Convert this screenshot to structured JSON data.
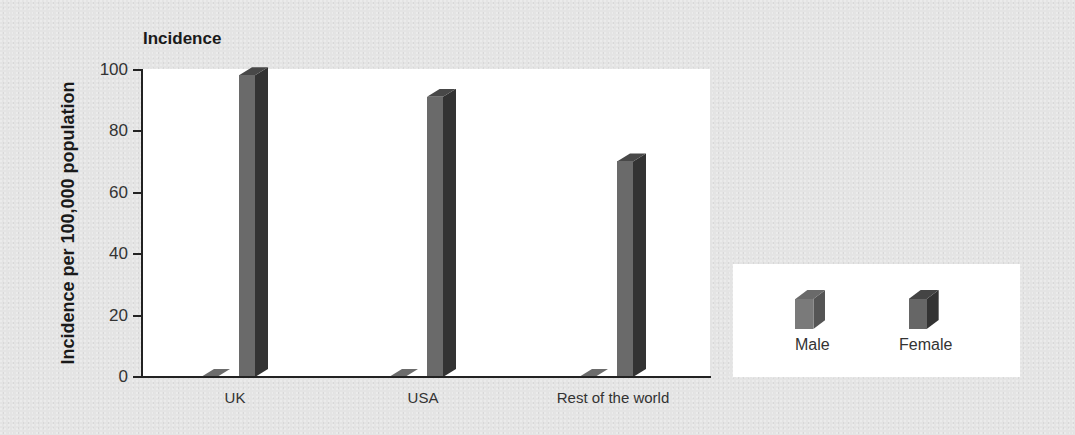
{
  "chart_data": {
    "type": "bar",
    "title": "Incidence",
    "xlabel": "",
    "ylabel": "Incidence per 100,000 population",
    "ylim": [
      0,
      100
    ],
    "yticks": [
      0,
      20,
      40,
      60,
      80,
      100
    ],
    "categories": [
      "UK",
      "USA",
      "Rest of the world"
    ],
    "series": [
      {
        "name": "Male",
        "values": [
          0,
          0,
          0
        ],
        "color": "#7a7a7a"
      },
      {
        "name": "Female",
        "values": [
          98,
          91,
          70
        ],
        "color": "#3a3a3a"
      }
    ],
    "grid": false,
    "legend_position": "right-bottom",
    "style": "3d-bar"
  },
  "title": "Incidence",
  "y_axis": {
    "label": "Incidence per 100,000 population",
    "ticks": [
      "100",
      "80",
      "60",
      "40",
      "20",
      "0"
    ]
  },
  "x_axis": {
    "labels": [
      "UK",
      "USA",
      "Rest of the world"
    ]
  },
  "legend": {
    "items": [
      {
        "label": "Male"
      },
      {
        "label": "Female"
      }
    ]
  }
}
